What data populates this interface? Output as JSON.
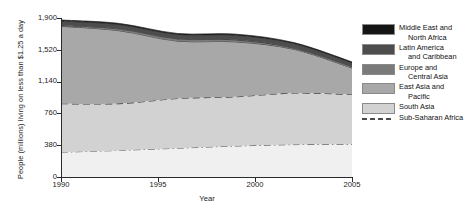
{
  "chart_data": {
    "type": "area",
    "stacked": true,
    "title": "",
    "xlabel": "Year",
    "ylabel": "People (millions) living on less than $1.25 a day",
    "xlim": [
      1990,
      2005
    ],
    "ylim": [
      0,
      1900
    ],
    "yticks": [
      "0",
      "380",
      "760",
      "1,140",
      "1,520",
      "1,900"
    ],
    "ytick_values": [
      0,
      380,
      760,
      1140,
      1520,
      1900
    ],
    "xticks": [
      "1990",
      "1995",
      "2000",
      "2005"
    ],
    "xtick_values": [
      1990,
      1995,
      2000,
      2005
    ],
    "grid": false,
    "legend_position": "right",
    "x": [
      1990,
      1993,
      1996,
      1999,
      2002,
      2005
    ],
    "series": [
      {
        "name": "Sub-Saharan Africa",
        "label_line1": "Sub-Saharan Africa",
        "label_line2": "",
        "color": "#f0f0f0",
        "boundary_style": "dash-dot",
        "values": [
          296,
          318,
          344,
          370,
          387,
          390
        ]
      },
      {
        "name": "South Asia",
        "label_line1": "South Asia",
        "label_line2": "",
        "color": "#d2d2d2",
        "boundary_style": "dashed",
        "values": [
          579,
          559,
          594,
          589,
          616,
          596
        ]
      },
      {
        "name": "East Asia and Pacific",
        "label_line1": "East Asia and",
        "label_line2": "Pacific",
        "color": "#a8a8a8",
        "boundary_style": "solid",
        "values": [
          926,
          871,
          686,
          656,
          523,
          316
        ]
      },
      {
        "name": "Europe and Central Asia",
        "label_line1": "Europe and",
        "label_line2": "Central Asia",
        "color": "#7a7a7a",
        "boundary_style": "solid",
        "values": [
          9,
          22,
          26,
          24,
          14,
          17
        ]
      },
      {
        "name": "Latin America and Caribbean",
        "label_line1": "Latin America",
        "label_line2": "and Caribbean",
        "color": "#4d4d4d",
        "boundary_style": "solid",
        "values": [
          53,
          52,
          53,
          56,
          55,
          45
        ]
      },
      {
        "name": "Middle East and North Africa",
        "label_line1": "Middle East and",
        "label_line2": "North Africa",
        "color": "#151515",
        "boundary_style": "solid",
        "values": [
          13,
          13,
          12,
          12,
          11,
          11
        ]
      }
    ]
  },
  "axis": {
    "y_title": "People (millions) living on less than $1.25 a day",
    "x_title": "Year"
  }
}
